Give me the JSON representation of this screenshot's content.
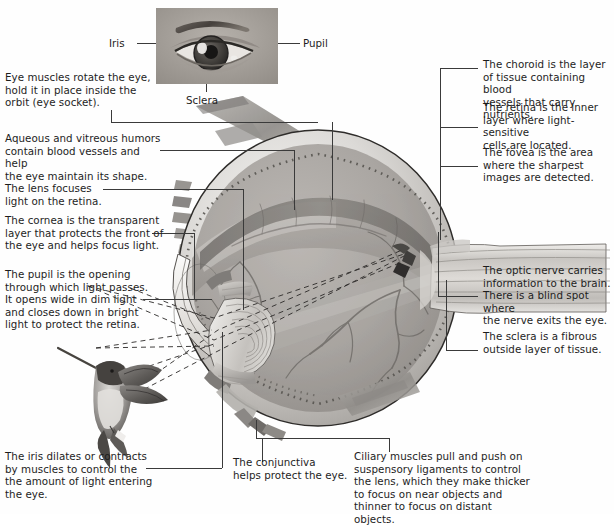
{
  "figure": {
    "background": "#fefefe",
    "ink": "#1d1d1d",
    "leader_color": "#3a3a3a"
  },
  "photo_labels": {
    "iris": "Iris",
    "pupil": "Pupil",
    "sclera": "Sclera"
  },
  "captions": {
    "eye_muscles": "Eye muscles rotate the eye,\nhold it in place inside the\norbit (eye socket).",
    "humors": "Aqueous and vitreous humors\ncontain blood vessels and help\nthe eye maintain its shape.",
    "lens": "The lens focuses\nlight on the retina.",
    "cornea": "The cornea is the transparent\nlayer that protects the front of\nthe eye and helps focus light.",
    "pupil": "The pupil is the opening\nthrough which light passes.\nIt opens wide in dim light\nand closes down in bright\nlight to protect the retina.",
    "iris": "The iris dilates or contracts\nby muscles to control the\nthe amount of light entering\nthe eye.",
    "conjunctiva": "The conjunctiva\nhelps protect the eye.",
    "ciliary": "Ciliary muscles pull and push on\nsuspensory ligaments to control\nthe lens, which they make thicker\nto focus on near objects and\nthinner to focus on distant objects.",
    "choroid": "The  choroid is the  layer\nof tissue containing blood\nvessels that carry nutrients.",
    "retina": "The retina is the inner\nlayer where light-sensitive\ncells are located.",
    "fovea": "The fovea is the area\nwhere the sharpest\nimages are detected.",
    "optic_nerve": "The optic nerve carries\ninformation to the brain.\nThere is a blind spot where\nthe nerve exits the eye.",
    "sclera": "The sclera is a fibrous\noutside layer of tissue."
  },
  "illustration": {
    "eye_photo": "photograph-of-human-eye",
    "cross_section": "eye-cross-section-illustration",
    "hummingbird": "hummingbird-photograph",
    "light_rays": "dashed-light-ray-lines"
  }
}
